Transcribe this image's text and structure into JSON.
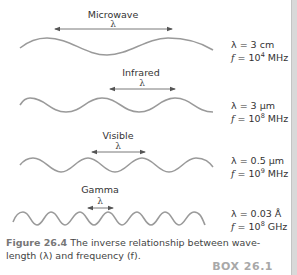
{
  "figure": {
    "waves": [
      {
        "name": "Microwave",
        "lambda_symbol": "λ",
        "wavelength_text": "λ = 3 cm",
        "freq_prefix": "f",
        "freq_eq": " = 10",
        "freq_exp": "4",
        "freq_unit": " MHz"
      },
      {
        "name": "Infrared",
        "lambda_symbol": "λ",
        "wavelength_text": "λ = 3 μm",
        "freq_prefix": "f",
        "freq_eq": " = 10",
        "freq_exp": "8",
        "freq_unit": " MHz"
      },
      {
        "name": "Visible",
        "lambda_symbol": "λ",
        "wavelength_text": "λ = 0.5 μm",
        "freq_prefix": "f",
        "freq_eq": " = 10",
        "freq_exp": "9",
        "freq_unit": " MHz"
      },
      {
        "name": "Gamma",
        "lambda_symbol": "λ",
        "wavelength_text": "λ = 0.03 Å",
        "freq_prefix": "f",
        "freq_eq": " = 10",
        "freq_exp": "8",
        "freq_unit": " GHz"
      }
    ],
    "caption": {
      "number": "Figure 26.4",
      "text": " The inverse relationship between wave-length (λ) and frequency (f)."
    },
    "box_label": "BOX 26.1",
    "colors": {
      "wave": "#9a9a9a",
      "arrow": "#555555",
      "box_label": "#a8a8a8",
      "edge": "#d9d9d9"
    }
  }
}
